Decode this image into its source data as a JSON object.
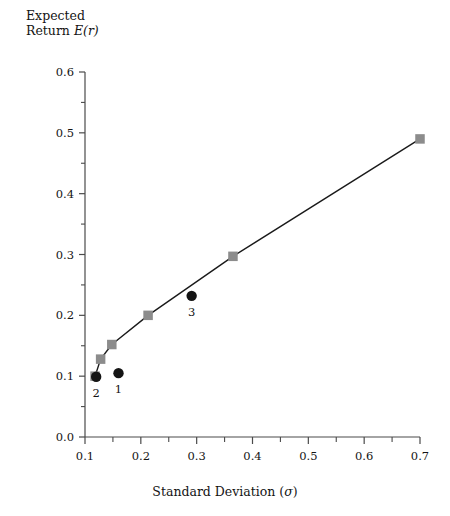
{
  "chart_data": {
    "type": "line",
    "title": "",
    "xlabel": "Standard Deviation (σ)",
    "ylabel": "Expected Return E(r)",
    "ylabel_line1": "Expected",
    "ylabel_line2_prefix": "Return ",
    "ylabel_line2_em": "E(r)",
    "xlabel_prefix": "Standard Deviation (",
    "xlabel_em": "σ",
    "xlabel_suffix": ")",
    "xlim": [
      0.1,
      0.7
    ],
    "ylim": [
      0.0,
      0.6
    ],
    "grid": false,
    "legend": "none",
    "x_ticks": [
      0.1,
      0.2,
      0.3,
      0.4,
      0.5,
      0.6,
      0.7
    ],
    "x_tick_labels": [
      "0.1",
      "0.2",
      "0.3",
      "0.4",
      "0.5",
      "0.6",
      "0.7"
    ],
    "x_minor_ticks": [
      0.15,
      0.25,
      0.35,
      0.45,
      0.55,
      0.65
    ],
    "y_ticks": [
      0.0,
      0.1,
      0.2,
      0.3,
      0.4,
      0.5,
      0.6
    ],
    "y_tick_labels": [
      "0.0",
      "0.1",
      "0.2",
      "0.3",
      "0.4",
      "0.5",
      "0.6"
    ],
    "y_minor_ticks": [
      0.05,
      0.15,
      0.25,
      0.35,
      0.45,
      0.55
    ],
    "series": [
      {
        "name": "efficient-frontier",
        "type": "line-with-square-markers",
        "color": "#8c8c8c",
        "line_color": "#1a1a1a",
        "marker": "square",
        "points": [
          {
            "x": 0.118,
            "y": 0.1
          },
          {
            "x": 0.128,
            "y": 0.128
          },
          {
            "x": 0.148,
            "y": 0.152
          },
          {
            "x": 0.213,
            "y": 0.2
          },
          {
            "x": 0.365,
            "y": 0.297
          },
          {
            "x": 0.7,
            "y": 0.49
          }
        ]
      },
      {
        "name": "individual-assets",
        "type": "scatter",
        "color": "#141414",
        "marker": "circle",
        "points": [
          {
            "x": 0.12,
            "y": 0.099,
            "label": "2"
          },
          {
            "x": 0.16,
            "y": 0.105,
            "label": "1"
          },
          {
            "x": 0.291,
            "y": 0.232,
            "label": "3"
          }
        ]
      }
    ]
  },
  "colors": {
    "marker_square": "#8c8c8c",
    "marker_circle": "#141414",
    "axis": "#4a4a4a",
    "line": "#1a1a1a",
    "background": "#ffffff"
  }
}
